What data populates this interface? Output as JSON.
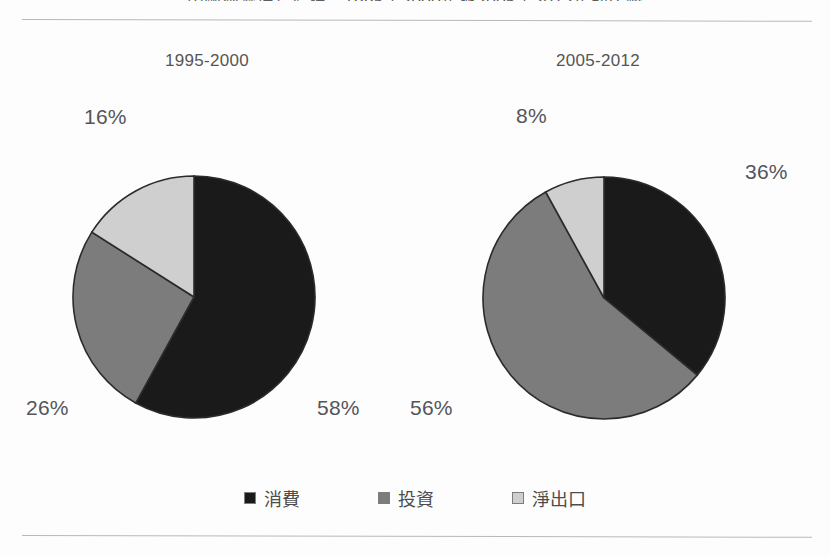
{
  "document": {
    "top_title_clipped": "中國經濟增長結構：1995至2000年與2005至2012年的比較"
  },
  "legend": {
    "position": "bottom-center",
    "items": [
      {
        "label": "消費",
        "key": "consumption",
        "color": "#1a1a1a",
        "swatch_name": "legend-swatch-consumption"
      },
      {
        "label": "投資",
        "key": "investment",
        "color": "#7c7c7c",
        "swatch_name": "legend-swatch-investment"
      },
      {
        "label": "淨出口",
        "key": "net_exports",
        "color": "#cfcfcf",
        "swatch_name": "legend-swatch-net-exports"
      }
    ]
  },
  "colors": {
    "consumption": "#1a1a1a",
    "investment": "#7c7c7c",
    "net_exports": "#cfcfcf",
    "outline": "#2b2b2b",
    "rule": "#b9b9b9",
    "text": "#55555a",
    "background": "#fdfdfd"
  },
  "charts": {
    "left": {
      "title": "1995-2000",
      "labels": {
        "consumption": "58%",
        "investment": "26%",
        "net_exports": "16%"
      }
    },
    "right": {
      "title": "2005-2012",
      "labels": {
        "consumption": "36%",
        "investment": "56%",
        "net_exports": "8%"
      }
    }
  },
  "chart_data": [
    {
      "type": "pie",
      "id": "pie-1995-2000",
      "title": "1995-2000",
      "categories": [
        "消費",
        "投資",
        "淨出口"
      ],
      "values": [
        58,
        26,
        16
      ],
      "value_unit": "%",
      "data_labels": [
        "58%",
        "26%",
        "16%"
      ],
      "colors": [
        "#1a1a1a",
        "#7c7c7c",
        "#cfcfcf"
      ],
      "start_angle_deg": 0,
      "direction": "clockwise",
      "legend": "bottom-center",
      "xlabel": "",
      "ylabel": ""
    },
    {
      "type": "pie",
      "id": "pie-2005-2012",
      "title": "2005-2012",
      "categories": [
        "消費",
        "投資",
        "淨出口"
      ],
      "values": [
        36,
        56,
        8
      ],
      "value_unit": "%",
      "data_labels": [
        "36%",
        "56%",
        "8%"
      ],
      "colors": [
        "#1a1a1a",
        "#7c7c7c",
        "#cfcfcf"
      ],
      "start_angle_deg": 0,
      "direction": "clockwise",
      "legend": "bottom-center",
      "xlabel": "",
      "ylabel": ""
    }
  ]
}
